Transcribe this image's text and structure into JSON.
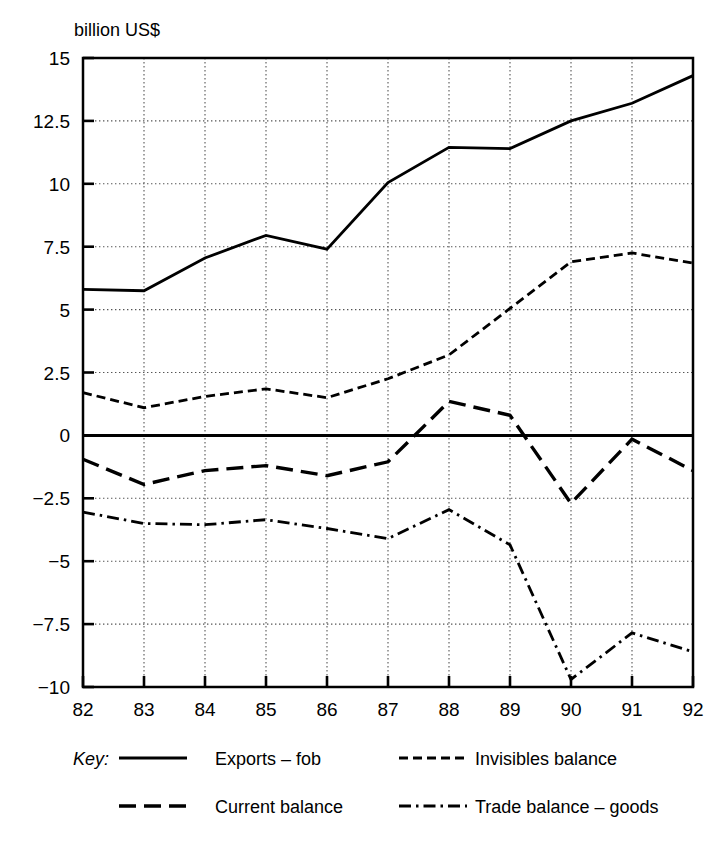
{
  "chart_data": {
    "type": "line",
    "title": "",
    "subtitle": "",
    "unit_label": "billion US$",
    "xlabel": "",
    "ylabel": "billion US$",
    "x": [
      82,
      83,
      84,
      85,
      86,
      87,
      88,
      89,
      90,
      91,
      92
    ],
    "categories": [
      "82",
      "83",
      "84",
      "85",
      "86",
      "87",
      "88",
      "89",
      "90",
      "91",
      "92"
    ],
    "xlim": [
      82,
      92
    ],
    "ylim": [
      -10,
      15
    ],
    "ytick_labels": [
      "15",
      "12.5",
      "10",
      "7.5",
      "5",
      "2.5",
      "0",
      "-2.5",
      "-5",
      "-7.5",
      "-10"
    ],
    "ytick_values": [
      15,
      12.5,
      10,
      7.5,
      5,
      2.5,
      0,
      -2.5,
      -5,
      -7.5,
      -10
    ],
    "xtick_labels": [
      "82",
      "83",
      "84",
      "85",
      "86",
      "87",
      "88",
      "89",
      "90",
      "91",
      "92"
    ],
    "grid": true,
    "grid_style": "dotted",
    "zero_line": true,
    "legend_position": "bottom",
    "legend_title": "Key:",
    "series": [
      {
        "name": "Exports – fob",
        "style": "solid",
        "values": [
          5.8,
          5.75,
          7.05,
          7.95,
          7.4,
          10.05,
          11.45,
          11.4,
          12.5,
          13.2,
          14.3
        ]
      },
      {
        "name": "Invisibles balance",
        "style": "dotted",
        "values": [
          1.7,
          1.1,
          1.55,
          1.85,
          1.5,
          2.25,
          3.2,
          5.05,
          6.9,
          7.25,
          6.85
        ]
      },
      {
        "name": "Current balance",
        "style": "dashed",
        "values": [
          -0.95,
          -1.95,
          -1.4,
          -1.2,
          -1.6,
          -1.05,
          1.35,
          0.8,
          -2.7,
          -0.15,
          -1.4
        ]
      },
      {
        "name": "Trade balance – goods",
        "style": "dashdot",
        "values": [
          -3.05,
          -3.5,
          -3.55,
          -3.35,
          -3.7,
          -4.1,
          -2.95,
          -4.35,
          -9.7,
          -7.85,
          -8.6
        ]
      }
    ]
  },
  "legend": {
    "key_label": "Key:",
    "entries": [
      {
        "label": "Exports – fob",
        "style": "solid"
      },
      {
        "label": "Invisibles balance",
        "style": "dotted"
      },
      {
        "label": "Current balance",
        "style": "dashed"
      },
      {
        "label": "Trade balance – goods",
        "style": "dashdot"
      }
    ]
  }
}
